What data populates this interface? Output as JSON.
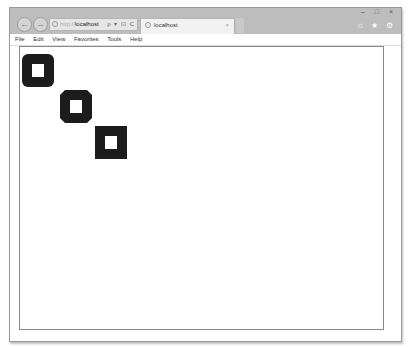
{
  "browser": {
    "nav": {
      "back_icon": "←",
      "forward_icon": "→"
    },
    "address": {
      "protocol": "http://",
      "host": "localhost",
      "tools": "ρ ▾ ⊡ C"
    },
    "tab": {
      "title": "localhost",
      "close_icon": "×"
    },
    "window_controls": {
      "minimize": "–",
      "maximize": "□",
      "close": "×"
    },
    "toolbar_icons": {
      "home": "⌂",
      "favorites": "★",
      "tools": "⚙"
    },
    "menu": [
      "File",
      "Edit",
      "View",
      "Favorites",
      "Tools",
      "Help"
    ]
  },
  "page": {
    "shapes": [
      {
        "name": "square-round-join",
        "left": 2,
        "top": 7,
        "join": "round"
      },
      {
        "name": "square-bevel-join",
        "left": 40,
        "top": 43,
        "join": "bevel"
      },
      {
        "name": "square-miter-join",
        "left": 75,
        "top": 79,
        "join": "miter"
      }
    ],
    "stroke_color": "#1c1c1c",
    "canvas_border_color": "#8a8a8a"
  }
}
